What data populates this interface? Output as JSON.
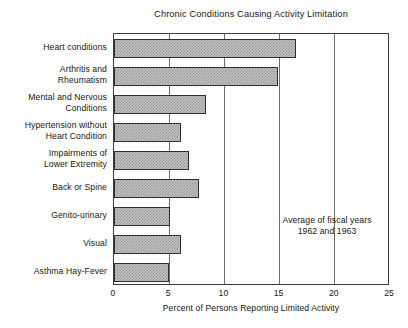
{
  "chart_data": {
    "type": "bar",
    "orientation": "horizontal",
    "title": "Chronic Conditions Causing Activity Limitation",
    "xlabel": "Percent of Persons Reporting Limited Activity",
    "ylabel": "",
    "xlim": [
      0,
      25
    ],
    "xticks": [
      "0",
      "5",
      "10",
      "15",
      "20",
      "25"
    ],
    "grid": true,
    "legend": false,
    "annotation_lines": [
      "Average of fiscal years",
      "1962 and 1963"
    ],
    "categories": [
      "Heart conditions",
      "Arthritis and Rheumatism",
      "Mental and Nervous Conditions",
      "Hypertension without Heart Condition",
      "Impairments of Lower Extremity",
      "Back or Spine",
      "Genito-urinary",
      "Visual",
      "Asthma  Hay-Fever"
    ],
    "category_label_lines": [
      [
        "Heart conditions"
      ],
      [
        "Arthritis and",
        "Rheumatism"
      ],
      [
        "Mental and Nervous",
        "Conditions"
      ],
      [
        "Hypertension without",
        "Heart Condition"
      ],
      [
        "Impairments of",
        "Lower Extremity"
      ],
      [
        "Back or Spine"
      ],
      [
        "Genito-urinary"
      ],
      [
        "Visual"
      ],
      [
        "Asthma   Hay-Fever"
      ]
    ],
    "values": [
      16.5,
      14.9,
      8.3,
      6.1,
      6.8,
      7.7,
      5.1,
      6.1,
      5.0
    ],
    "bar_fill_color": "#c3c3c3",
    "bar_edge_color": "#2f2f2f",
    "axis_color": "#3b3b3b"
  }
}
